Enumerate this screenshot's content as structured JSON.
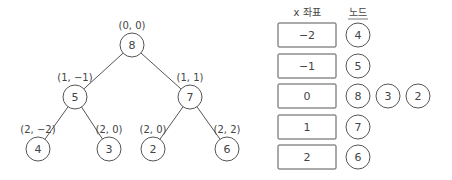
{
  "tree": {
    "nodes": [
      {
        "id": "n8",
        "value": "8",
        "coord": "(0, 0)",
        "cx": 132,
        "cy": 45
      },
      {
        "id": "n5",
        "value": "5",
        "coord": "(1, −1)",
        "cx": 75,
        "cy": 97
      },
      {
        "id": "n7",
        "value": "7",
        "coord": "(1, 1)",
        "cx": 190,
        "cy": 97
      },
      {
        "id": "n4",
        "value": "4",
        "coord": "(2, −2)",
        "cx": 38,
        "cy": 149
      },
      {
        "id": "n3",
        "value": "3",
        "coord": "(2, 0)",
        "cx": 109,
        "cy": 149
      },
      {
        "id": "n2",
        "value": "2",
        "coord": "(2, 0)",
        "cx": 153,
        "cy": 149
      },
      {
        "id": "n6",
        "value": "6",
        "coord": "(2, 2)",
        "cx": 227,
        "cy": 149
      }
    ],
    "edges": [
      [
        "n8",
        "n5"
      ],
      [
        "n8",
        "n7"
      ],
      [
        "n5",
        "n4"
      ],
      [
        "n5",
        "n3"
      ],
      [
        "n7",
        "n2"
      ],
      [
        "n7",
        "n6"
      ]
    ]
  },
  "table": {
    "header_x": "x 좌표",
    "header_nodes": "노드",
    "rows": [
      {
        "x": "−2",
        "nodes": [
          "4"
        ]
      },
      {
        "x": "−1",
        "nodes": [
          "5"
        ]
      },
      {
        "x": "0",
        "nodes": [
          "8",
          "3",
          "2"
        ]
      },
      {
        "x": "1",
        "nodes": [
          "7"
        ]
      },
      {
        "x": "2",
        "nodes": [
          "6"
        ]
      }
    ]
  }
}
